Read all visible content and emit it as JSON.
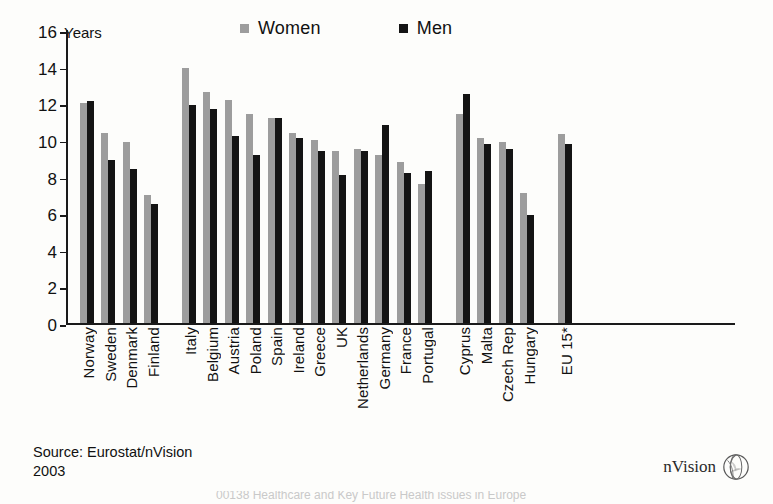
{
  "chart_data": {
    "type": "bar",
    "title": "",
    "xlabel": "",
    "ylabel": "Years",
    "ylim": [
      0,
      16
    ],
    "yticks": [
      0,
      2,
      4,
      6,
      8,
      10,
      12,
      14,
      16
    ],
    "grid": false,
    "legend_position": "top",
    "categories": [
      "Norway",
      "Sweden",
      "Denmark",
      "Finland",
      "Italy",
      "Belgium",
      "Austria",
      "Poland",
      "Spain",
      "Ireland",
      "Greece",
      "UK",
      "Netherlands",
      "Germany",
      "France",
      "Portugal",
      "Cyprus",
      "Malta",
      "Czech Rep",
      "Hungary",
      "EU 15*"
    ],
    "group_breaks_after": [
      "Finland",
      "Portugal",
      "Hungary"
    ],
    "series": [
      {
        "name": "Women",
        "color": "#9d9d9d",
        "values": [
          12.0,
          10.4,
          9.9,
          7.0,
          13.9,
          12.6,
          12.2,
          11.4,
          11.2,
          10.4,
          10.0,
          9.4,
          9.5,
          9.2,
          8.8,
          7.6,
          11.4,
          10.1,
          9.9,
          7.1,
          10.3
        ]
      },
      {
        "name": "Men",
        "color": "#141414",
        "values": [
          12.1,
          8.9,
          8.4,
          6.5,
          11.9,
          11.7,
          10.2,
          9.2,
          11.2,
          10.1,
          9.4,
          8.1,
          9.4,
          10.8,
          8.2,
          8.3,
          12.5,
          9.8,
          9.5,
          5.9,
          9.8
        ]
      }
    ]
  },
  "legend": {
    "items": [
      {
        "label": "Women",
        "swatch": "women"
      },
      {
        "label": "Men",
        "swatch": "men"
      }
    ]
  },
  "axis": {
    "unit_label": "Years"
  },
  "footer": {
    "source_line1": "Source: Eurostat/nVision",
    "source_line2": "2003",
    "logo_text": "nVision",
    "logo_icon": "globe-icon",
    "bottom_caption": "00138  Healthcare and Key Future Health issues in Europe"
  }
}
